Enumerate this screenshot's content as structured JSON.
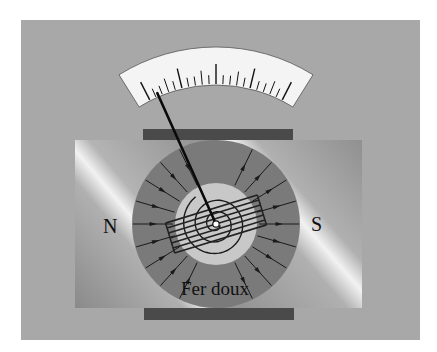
{
  "diagram": {
    "labels": {
      "north": "N",
      "south": "S",
      "core": "Fer doux"
    },
    "scale": {
      "major_ticks": 5,
      "minor_per_major": 4,
      "needle_fraction": 0.07
    },
    "field_lines": {
      "left_count": 9,
      "right_count": 9,
      "direction": "north-to-south"
    },
    "colors": {
      "background": "#a3a3a3",
      "panel": "#a8a8a8",
      "magnet_dark": "#8c8c8c",
      "magnet_light": "#ececec",
      "pole_ring": "#7a7a7a",
      "core": "#c8c8c8",
      "scale_face": "#f4f4f4",
      "bar": "#4a4a4a",
      "ink": "#111111"
    }
  }
}
